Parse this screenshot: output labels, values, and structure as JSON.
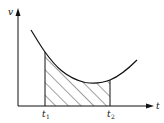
{
  "diagram": {
    "y_axis_label": "v",
    "x_axis_label": "t",
    "markers": [
      {
        "base": "t",
        "sub": "1"
      },
      {
        "base": "t",
        "sub": "2"
      }
    ],
    "shaded_region": "area under curve from t1 to t2",
    "colors": {
      "line": "#111111",
      "background": "#ffffff"
    }
  }
}
